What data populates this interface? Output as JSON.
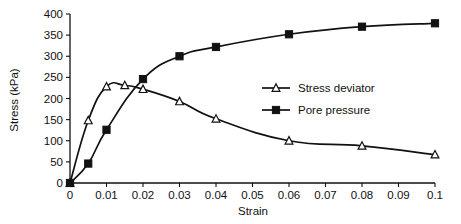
{
  "chart_data": {
    "type": "line",
    "title": "",
    "xlabel": "Strain",
    "ylabel": "Stress (kPa)",
    "xlim": [
      0,
      0.1
    ],
    "ylim": [
      0,
      400
    ],
    "grid": false,
    "legend_position": "inside-center-right",
    "xticks": [
      "0",
      "0.01",
      "0.02",
      "0.03",
      "0.04",
      "0.05",
      "0.06",
      "0.07",
      "0.08",
      "0.09",
      "0.1"
    ],
    "xtick_values": [
      0,
      0.01,
      0.02,
      0.03,
      0.04,
      0.05,
      0.06,
      0.07,
      0.08,
      0.09,
      0.1
    ],
    "yticks": [
      "0",
      "50",
      "100",
      "150",
      "200",
      "250",
      "300",
      "350",
      "400"
    ],
    "ytick_values": [
      0,
      50,
      100,
      150,
      200,
      250,
      300,
      350,
      400
    ],
    "series": [
      {
        "name": "Stress deviator",
        "marker": "open-triangle",
        "x": [
          0,
          0.005,
          0.01,
          0.015,
          0.02,
          0.03,
          0.04,
          0.06,
          0.08,
          0.1
        ],
        "values": [
          0,
          148,
          228,
          231,
          222,
          193,
          152,
          100,
          88,
          67
        ]
      },
      {
        "name": "Pore pressure",
        "marker": "filled-square",
        "x": [
          0,
          0.005,
          0.01,
          0.02,
          0.03,
          0.04,
          0.06,
          0.08,
          0.1
        ],
        "values": [
          0,
          46,
          126,
          246,
          300,
          322,
          352,
          370,
          378
        ]
      }
    ]
  },
  "legend": {
    "entries": [
      {
        "label": "Stress deviator",
        "marker": "open-triangle"
      },
      {
        "label": "Pore pressure",
        "marker": "filled-square"
      }
    ]
  }
}
